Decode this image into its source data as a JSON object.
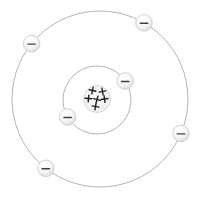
{
  "diagram": {
    "type": "bohr-atom-model",
    "element_depicted": "carbon-like atom (6 protons, 6 electrons)",
    "canvas": {
      "width": 197,
      "height": 197
    },
    "colors": {
      "background": "#ffffff",
      "orbit": "#b4b4b4",
      "nucleus_fill_center": "#fbfbfb",
      "nucleus_fill_edge": "#e3e3e3",
      "nucleus_edge": "#d5d5d5",
      "nucleus_speckle": "#cfcfcf",
      "proton_symbol": "#1f1f1f",
      "electron_fill_center": "#ffffff",
      "electron_fill_edge": "#d8d8d8",
      "electron_edge": "#c9c9c9",
      "electron_symbol": "#404040"
    },
    "orbits": {
      "inner": {
        "cx": 97,
        "cy": 100,
        "r": 34
      },
      "outer": {
        "cx": 100,
        "cy": 99,
        "r": 88
      }
    },
    "nucleus": {
      "cx": 97,
      "cy": 99,
      "r": 13.5,
      "proton_symbol": "+",
      "proton_count": 6,
      "proton_positions": [
        {
          "x": 92.5,
          "y": 90.5
        },
        {
          "x": 102.5,
          "y": 91.5
        },
        {
          "x": 88.5,
          "y": 98.5
        },
        {
          "x": 97,
          "y": 99.5
        },
        {
          "x": 104.5,
          "y": 99
        },
        {
          "x": 95.5,
          "y": 106.5
        }
      ]
    },
    "electrons": {
      "symbol": "−",
      "radius": 8.3,
      "count": 6,
      "items": [
        {
          "shell": "inner",
          "angle_deg": -34
        },
        {
          "shell": "inner",
          "angle_deg": 150
        },
        {
          "shell": "outer",
          "angle_deg": -60
        },
        {
          "shell": "outer",
          "angle_deg": -141
        },
        {
          "shell": "outer",
          "angle_deg": 23
        },
        {
          "shell": "outer",
          "angle_deg": 128
        }
      ]
    }
  }
}
